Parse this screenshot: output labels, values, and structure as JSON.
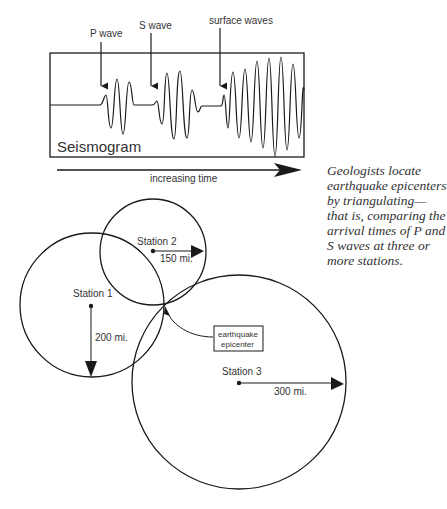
{
  "seismogram": {
    "box_label": "Seismogram",
    "wave_labels": {
      "p_wave": "P wave",
      "s_wave": "S wave",
      "surface_waves": "surface waves"
    },
    "time_axis_label": "increasing time"
  },
  "caption": "Geologists locate earthquake epicenters by triangulating—that is, comparing the arrival times of P and S waves at three or more stations.",
  "stations": [
    {
      "name": "Station 1",
      "distance": "200 mi."
    },
    {
      "name": "Station 2",
      "distance": "150 mi."
    },
    {
      "name": "Station 3",
      "distance": "300 mi."
    }
  ],
  "epicenter_label": {
    "line1": "earthquake",
    "line2": "epicenter"
  },
  "colors": {
    "ink": "#1a1a1a",
    "text": "#333333",
    "background": "#ffffff"
  }
}
